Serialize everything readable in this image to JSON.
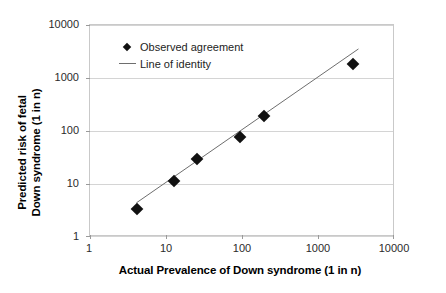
{
  "chart_data": {
    "type": "scatter",
    "title": "",
    "xlabel": "Actual Prevalence of Down syndrome (1 in n)",
    "ylabel_line1": "Predicted risk of fetal",
    "ylabel_line2": "Down syndrome (1 in n)",
    "xscale": "log",
    "yscale": "log",
    "xlim": [
      1,
      10000
    ],
    "ylim": [
      1,
      10000
    ],
    "xticks": [
      "1",
      "10",
      "100",
      "1000",
      "10000"
    ],
    "yticks": [
      "1",
      "10",
      "100",
      "1000",
      "10000"
    ],
    "grid": "horizontal",
    "legend_position": "upper-left-inside",
    "series": [
      {
        "name": "Observed agreement",
        "marker": "diamond",
        "color": "#111111",
        "x": [
          4.1,
          12.8,
          25,
          93,
          190,
          2800
        ],
        "y": [
          3.4,
          11.5,
          29,
          76,
          190,
          1800
        ]
      },
      {
        "name": "Line of identity",
        "marker": "line",
        "color": "#6e6e6e",
        "x": [
          4.1,
          3500
        ],
        "y": [
          4.1,
          3500
        ]
      }
    ],
    "legend": [
      {
        "label": "Observed agreement",
        "key": "diamond-marker"
      },
      {
        "label": "Line of identity",
        "key": "line-marker"
      }
    ]
  }
}
